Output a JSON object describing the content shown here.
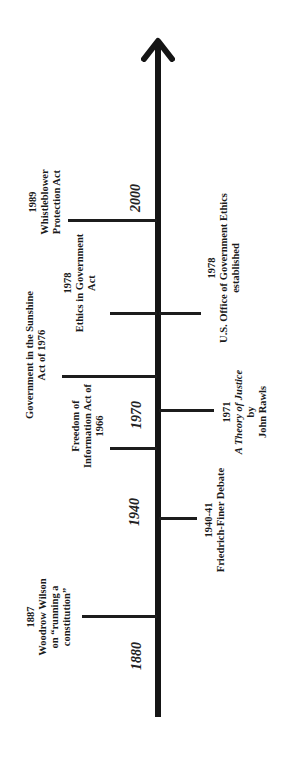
{
  "diagram": {
    "type": "timeline",
    "orientation": "rotated-90-ccw (time flows upward)",
    "axis": {
      "direction": "up",
      "arrow": "arrowhead at top",
      "color": "#151515"
    },
    "year_markers": [
      {
        "label": "1880"
      },
      {
        "label": "1940"
      },
      {
        "label": "1970"
      },
      {
        "label": "2000"
      }
    ],
    "events_left": [
      {
        "id": "wilson",
        "lines": [
          "1887",
          "Woodrow Wilson",
          "on “running a",
          "constitution”"
        ]
      },
      {
        "id": "foia",
        "lines": [
          "Freedom of",
          "Information Act of",
          "1966"
        ]
      },
      {
        "id": "sunshine",
        "lines": [
          "Government in the Sunshine",
          "Act of 1976"
        ]
      },
      {
        "id": "ethics-act",
        "lines": [
          "1978",
          "Ethics in Government",
          "Act"
        ]
      },
      {
        "id": "whistleblower",
        "lines": [
          "1989",
          "Whistleblower",
          "Protection Act"
        ]
      }
    ],
    "events_right": [
      {
        "id": "friedrich-finer",
        "lines": [
          "1940-41",
          "Friedrich-Finer Debate"
        ]
      },
      {
        "id": "rawls",
        "lines": [
          "1971",
          "A Theory of Justice",
          "by",
          "John Rawls"
        ]
      },
      {
        "id": "oge",
        "lines": [
          "1978",
          "U.S. Office of Government Ethics",
          "established"
        ]
      }
    ]
  }
}
